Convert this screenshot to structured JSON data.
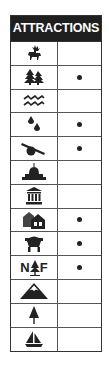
{
  "header": {
    "title": "ATTRACTIONS"
  },
  "rows": [
    {
      "icon": "wildlife-elk-icon",
      "available": false
    },
    {
      "icon": "forest-trees-icon",
      "available": true
    },
    {
      "icon": "water-waves-icon",
      "available": false
    },
    {
      "icon": "water-drops-icon",
      "available": true
    },
    {
      "icon": "cannon-historic-icon",
      "available": true
    },
    {
      "icon": "capitol-dome-icon",
      "available": false
    },
    {
      "icon": "museum-building-icon",
      "available": false
    },
    {
      "icon": "houses-village-icon",
      "available": true
    },
    {
      "icon": "mine-cart-icon",
      "available": true
    },
    {
      "icon": "national-forest-icon",
      "label_left": "N",
      "label_right": "F",
      "available": true
    },
    {
      "icon": "mountain-icon",
      "available": false
    },
    {
      "icon": "pine-tree-icon",
      "available": false
    },
    {
      "icon": "sailboat-icon",
      "available": false
    }
  ],
  "colors": {
    "header_bg": "#1f1f1f",
    "header_text": "#ffffff",
    "icon": "#222222"
  }
}
